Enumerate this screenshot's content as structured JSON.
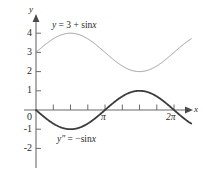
{
  "figure": {
    "background": "#ffffff",
    "axis_color": "#6b6b6b",
    "text_color": "#2a2a2a"
  },
  "axes": {
    "x_axis_name": "x",
    "y_axis_name": "y",
    "y_tick_labels": [
      "4",
      "3",
      "2",
      "1",
      "0",
      "-1",
      "-2"
    ],
    "x_tick_labels": [
      "π",
      "2π"
    ]
  },
  "curves": {
    "upper": {
      "label_y": "y",
      "label_eq": " = 3 + sin",
      "label_var": "x",
      "color": "#9a9a9a"
    },
    "lower": {
      "label_y": "y″",
      "label_eq": " = −sin",
      "label_var": "x",
      "color": "#3c3c3c"
    }
  },
  "chart_data": {
    "type": "line",
    "title": "",
    "xlabel": "x",
    "ylabel": "y",
    "xlim": [
      -0.25,
      7.4
    ],
    "ylim": [
      -2.6,
      4.9
    ],
    "grid": false,
    "legend": "inline-annotations",
    "x_ticks": [
      0,
      0.7854,
      1.5708,
      2.3562,
      3.1416,
      3.927,
      4.7124,
      5.4978,
      6.2832
    ],
    "x_tick_labels": [
      "0",
      "",
      "",
      "",
      "π",
      "",
      "",
      "",
      "2π"
    ],
    "y_ticks": [
      -2,
      -1,
      0,
      1,
      2,
      3,
      4
    ],
    "y_tick_labels": [
      "-2",
      "-1",
      "0",
      "1",
      "2",
      "3",
      "4"
    ],
    "series": [
      {
        "name": "y = 3 + sin x",
        "color": "#9a9a9a",
        "linewidth": 1,
        "x": [
          0,
          0.3927,
          0.7854,
          1.1781,
          1.5708,
          1.9635,
          2.3562,
          2.7489,
          3.1416,
          3.5343,
          3.927,
          4.3197,
          4.7124,
          5.1051,
          5.4978,
          5.8905,
          6.2832,
          6.6759,
          7.0686
        ],
        "values": [
          3.0,
          3.383,
          3.707,
          3.924,
          4.0,
          3.924,
          3.707,
          3.383,
          3.0,
          2.617,
          2.293,
          2.076,
          2.0,
          2.076,
          2.293,
          2.617,
          3.0,
          3.383,
          3.707
        ]
      },
      {
        "name": "y'' = -sin x",
        "color": "#3c3c3c",
        "linewidth": 1.8,
        "x": [
          0,
          0.3927,
          0.7854,
          1.1781,
          1.5708,
          1.9635,
          2.3562,
          2.7489,
          3.1416,
          3.5343,
          3.927,
          4.3197,
          4.7124,
          5.1051,
          5.4978,
          5.8905,
          6.2832,
          6.6759,
          7.0686
        ],
        "values": [
          0.0,
          -0.383,
          -0.707,
          -0.924,
          -1.0,
          -0.924,
          -0.707,
          -0.383,
          0.0,
          0.383,
          0.707,
          0.924,
          1.0,
          0.924,
          0.707,
          0.383,
          0.0,
          -0.383,
          -0.707
        ]
      }
    ],
    "annotations": [
      {
        "text": "y = 3 + sin x",
        "x": 1.2,
        "y": 4.6
      },
      {
        "text": "y'' = -sin x",
        "x": 1.5,
        "y": -1.55
      }
    ]
  }
}
